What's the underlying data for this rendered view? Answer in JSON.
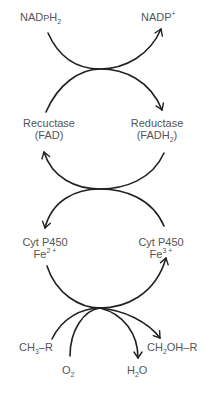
{
  "diagram": {
    "colors": {
      "line": "#222222",
      "text": "#555555",
      "background": "#ffffff"
    },
    "nodes": {
      "nadph2": {
        "base": "NAD",
        "mid": "P",
        "after": "H",
        "sub": "2"
      },
      "nadp_plus": {
        "base": "NADP",
        "sup": "+"
      },
      "reductase_fad": {
        "line1": "Recuctase",
        "line2": "(FAD)"
      },
      "reductase_fadh2": {
        "line1": "Reductase",
        "line2_base": "(FADH",
        "line2_sub": "2",
        "line2_end": ")"
      },
      "cyt_fe2": {
        "line1": "Cyt P450",
        "line2_base": "Fe",
        "line2_sup": "2 +"
      },
      "cyt_fe3": {
        "line1": "Cyt P450",
        "line2_base": "Fe",
        "line2_sup": "3 +"
      },
      "substrate": {
        "base": "CH",
        "sub": "3",
        "end": "–R"
      },
      "oxygen": {
        "base": "O",
        "sub": "2"
      },
      "water": {
        "base": "H",
        "sub": "2",
        "end": "O"
      },
      "product": {
        "base": "CH",
        "sub": "2",
        "end": "OH–R"
      }
    },
    "edges": [
      {
        "from": "NADPH2",
        "to": "NADP+",
        "stage": 1
      },
      {
        "from": "Reductase (FAD)",
        "to": "Reductase (FADH2)",
        "stage": 1
      },
      {
        "from": "Reductase (FADH2)",
        "to": "Reductase (FAD)",
        "stage": 2
      },
      {
        "from": "Cyt P450 Fe3+",
        "to": "Cyt P450 Fe2+",
        "stage": 2
      },
      {
        "from": "Cyt P450 Fe2+",
        "to": "Cyt P450 Fe3+",
        "stage": 3
      },
      {
        "from": "CH3-R",
        "to": "CH2OH-R",
        "stage": 3
      },
      {
        "from": "O2",
        "to": "H2O",
        "stage": 3
      }
    ]
  }
}
